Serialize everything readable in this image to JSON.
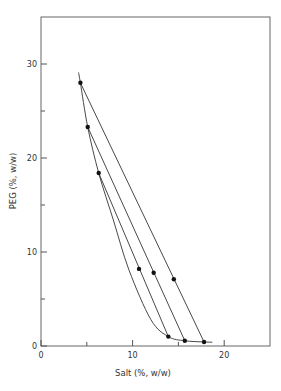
{
  "chart_data": {
    "type": "scatter",
    "title": "",
    "xlabel": "Salt (%, w/w)",
    "ylabel": "PEG (%, w/w)",
    "xlim": [
      0,
      25
    ],
    "ylim": [
      0,
      35
    ],
    "xticks": [
      0,
      10,
      20
    ],
    "xtick_labels": [
      "0",
      "10",
      "20"
    ],
    "x_minor_ticks": [
      5,
      15
    ],
    "yticks": [
      0,
      10,
      20,
      30
    ],
    "ytick_labels": [
      "0",
      "10",
      "20",
      "30"
    ],
    "y_minor_ticks": [
      5,
      15,
      25
    ],
    "grid": false,
    "legend": "none",
    "binodal_curve": {
      "name": "binodal",
      "x": [
        4.1,
        4.3,
        5.1,
        6.3,
        7.9,
        9.6,
        12.0,
        13.9,
        15.7,
        17.8,
        18.7
      ],
      "y": [
        29.1,
        28.0,
        23.3,
        18.4,
        13.4,
        8.1,
        2.8,
        1.0,
        0.56,
        0.43,
        0.4
      ]
    },
    "tie_lines": [
      {
        "name": "tie-line-1",
        "top": [
          4.3,
          28.0
        ],
        "middle": [
          14.5,
          7.1
        ],
        "bottom": [
          17.8,
          0.43
        ]
      },
      {
        "name": "tie-line-2",
        "top": [
          5.1,
          23.3
        ],
        "middle": [
          12.3,
          7.8
        ],
        "bottom": [
          15.7,
          0.56
        ]
      },
      {
        "name": "tie-line-3",
        "top": [
          6.3,
          18.4
        ],
        "middle": [
          10.7,
          8.2
        ],
        "bottom": [
          13.9,
          1.0
        ]
      }
    ],
    "colors": {
      "line": "#333333",
      "marker": "#111111",
      "axis": "#555555"
    }
  }
}
